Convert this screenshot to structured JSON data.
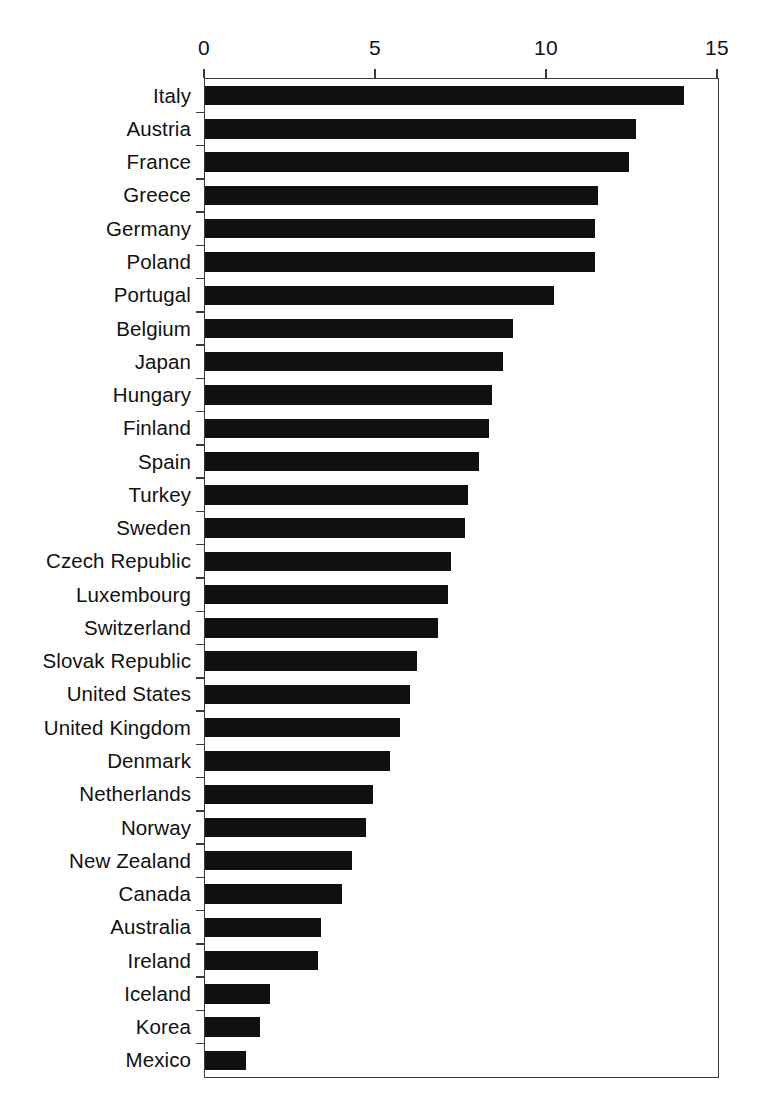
{
  "chart_data": {
    "type": "bar",
    "orientation": "horizontal",
    "title": "",
    "xlabel": "",
    "ylabel": "",
    "xlim": [
      0,
      15
    ],
    "xticks": [
      0,
      5,
      10,
      15
    ],
    "xtick_labels": [
      "0",
      "5",
      "10",
      "15"
    ],
    "grid": false,
    "legend": null,
    "bar_color": "#101010",
    "axis_color": "#3a3a3a",
    "background": "#ffffff",
    "categories": [
      "Italy",
      "Austria",
      "France",
      "Greece",
      "Germany",
      "Poland",
      "Portugal",
      "Belgium",
      "Japan",
      "Hungary",
      "Finland",
      "Spain",
      "Turkey",
      "Sweden",
      "Czech Republic",
      "Luxembourg",
      "Switzerland",
      "Slovak Republic",
      "United States",
      "United Kingdom",
      "Denmark",
      "Netherlands",
      "Norway",
      "New Zealand",
      "Canada",
      "Australia",
      "Ireland",
      "Iceland",
      "Korea",
      "Mexico"
    ],
    "values": [
      14.0,
      12.6,
      12.4,
      11.5,
      11.4,
      11.4,
      10.2,
      9.0,
      8.7,
      8.4,
      8.3,
      8.0,
      7.7,
      7.6,
      7.2,
      7.1,
      6.8,
      6.2,
      6.0,
      5.7,
      5.4,
      4.9,
      4.7,
      4.3,
      4.0,
      3.4,
      3.3,
      1.9,
      1.6,
      1.2
    ]
  }
}
